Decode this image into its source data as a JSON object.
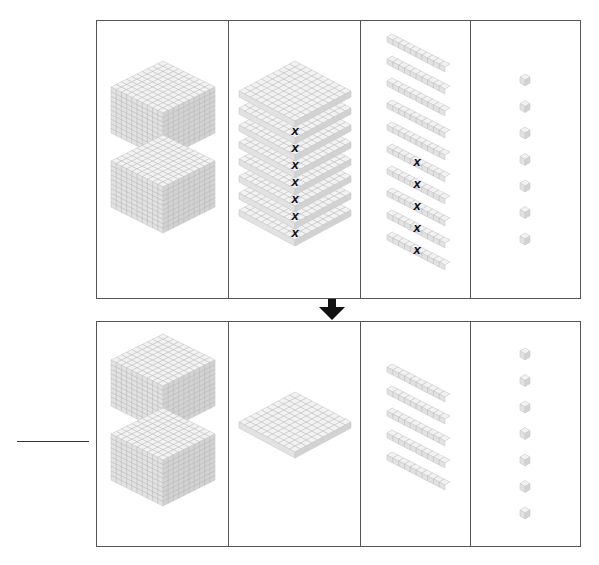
{
  "diagram": {
    "before": {
      "thousands_cubes": 2,
      "hundreds_flats": 8,
      "hundreds_crossed": 7,
      "tens_rods": 10,
      "tens_crossed": 5,
      "ones_units": 7
    },
    "arrow": "down-arrow",
    "after": {
      "thousands_cubes": 2,
      "hundreds_flats": 1,
      "tens_rods": 5,
      "ones_units": 7
    },
    "answer_blank": "",
    "colors": {
      "border": "#555555",
      "block_top": "#f2f2f2",
      "block_left": "#e2e2e2",
      "block_right": "#d2d2d2",
      "grid": "#b8b8b8",
      "cross": "#111111"
    }
  }
}
